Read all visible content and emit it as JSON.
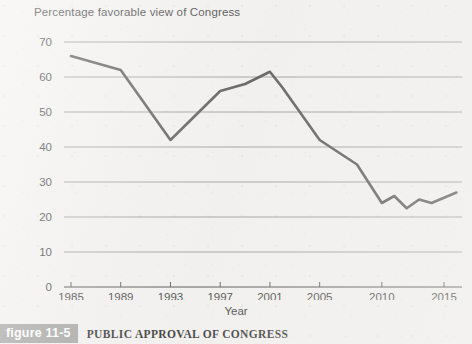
{
  "chart_title": "Percentage favorable view of Congress",
  "xaxis_title": "Year",
  "caption": {
    "badge": "figure 11-5",
    "text": "PUBLIC APPROVAL OF CONGRESS"
  },
  "colors": {
    "background": "#f2f1ef",
    "line": "#4a4a4a",
    "gridline": "#8d8d8d",
    "axis": "#3a3a3a",
    "badge_background": "#9c9c9c",
    "badge_text": "#ffffff"
  },
  "chart_data": {
    "type": "line",
    "title": "Percentage favorable view of Congress",
    "xlabel": "Year",
    "ylabel": "Percentage favorable view of Congress",
    "xlim": [
      1985,
      2016
    ],
    "ylim": [
      0,
      70
    ],
    "grid": true,
    "legend": "none",
    "ytick_labels": [
      "0",
      "10",
      "20",
      "30",
      "40",
      "50",
      "60",
      "70"
    ],
    "ytick_values": [
      0,
      10,
      20,
      30,
      40,
      50,
      60,
      70
    ],
    "xtick_labels": [
      "1985",
      "1989",
      "1993",
      "1997",
      "2001",
      "2005",
      "2010",
      "2015"
    ],
    "xtick_values": [
      1985,
      1989,
      1993,
      1997,
      2001,
      2005,
      2010,
      2015
    ],
    "series": [
      {
        "name": "Percentage favorable view of Congress",
        "x": [
          1985,
          1989,
          1993,
          1997,
          1999,
          2001,
          2002,
          2005,
          2008,
          2010,
          2011,
          2012,
          2013,
          2014,
          2015,
          2016
        ],
        "values": [
          66,
          62,
          42,
          56,
          58,
          61.5,
          57,
          42,
          35,
          24,
          26,
          22.5,
          25,
          24,
          25.5,
          27
        ]
      }
    ]
  }
}
